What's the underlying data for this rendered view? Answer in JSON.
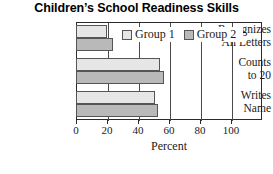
{
  "chart_data": {
    "type": "bar",
    "orientation": "horizontal",
    "title": "Children’s School Readiness Skills",
    "xlabel": "Percent",
    "ylabel": "",
    "categories": [
      "Recognizes All Letters",
      "Counts to 20",
      "Writes Name"
    ],
    "series": [
      {
        "name": "Group 1",
        "color": "#e6e6e6",
        "values": [
          20,
          54,
          51
        ]
      },
      {
        "name": "Group 2",
        "color": "#b9b9b9",
        "values": [
          24,
          57,
          53
        ]
      }
    ],
    "xlim": [
      0,
      120
    ],
    "xticks": [
      0,
      20,
      40,
      60,
      80,
      100
    ],
    "xtick_labels": [
      "0",
      "20",
      "40",
      "60",
      "80",
      "100"
    ],
    "grid": true,
    "legend_position": "top-right-inside"
  },
  "legend": {
    "entries": [
      {
        "label": "Group 1",
        "swatch": "light-gray-swatch"
      },
      {
        "label": "Group 2",
        "swatch": "dark-gray-swatch"
      }
    ]
  },
  "category_labels": [
    {
      "line1": "Recognizes",
      "line2": "All Letters"
    },
    {
      "line1": "Counts",
      "line2": "to 20"
    },
    {
      "line1": "Writes",
      "line2": "Name"
    }
  ]
}
